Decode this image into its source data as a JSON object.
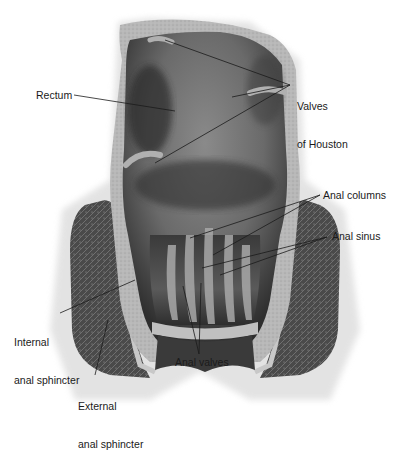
{
  "figure": {
    "style": "grayscale anatomical illustration"
  },
  "labels": {
    "rectum": "Rectum",
    "valves_of_houston_1": "Valves",
    "valves_of_houston_2": "of Houston",
    "anal_columns": "Anal columns",
    "anal_sinus": "Anal sinus",
    "internal_sphincter_1": "Internal",
    "internal_sphincter_2": "anal sphincter",
    "external_sphincter_1": "External",
    "external_sphincter_2": "anal sphincter",
    "anal_valves": "Anal valves"
  },
  "colors": {
    "background": "#ffffff",
    "text": "#1a1a1a",
    "leader_line": "#1a1a1a",
    "lumen_dark": "#3a3a3a",
    "lumen_mid": "#6e6e6e",
    "wall_light": "#c4c4c4",
    "muscle_dark": "#4a4a4a"
  }
}
